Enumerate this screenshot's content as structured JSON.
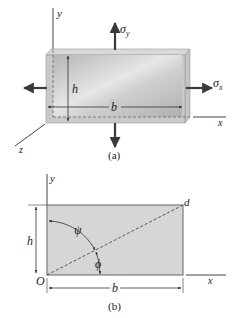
{
  "figure_a": {
    "caption": "(a)",
    "axis_labels": {
      "y": "y",
      "x": "x",
      "z": "z"
    },
    "dimension_labels": {
      "height": "h",
      "width": "b"
    },
    "stress_labels": {
      "sigma_y": "σ",
      "sigma_y_sub": "y",
      "sigma_x": "σ",
      "sigma_x_sub": "x"
    }
  },
  "figure_b": {
    "caption": "(b)",
    "axis_labels": {
      "y": "y",
      "x": "x"
    },
    "point_labels": {
      "origin": "O",
      "corner": "d"
    },
    "dimension_labels": {
      "height": "h",
      "width": "b"
    },
    "angle_labels": {
      "psi": "ψ",
      "phi": "ϕ"
    }
  },
  "colors": {
    "line": "#333333",
    "plate_face": "#c8c8c8",
    "plate_edge": "#b8b8b8",
    "rect_fill": "#d6d6d6",
    "arrow": "#3a3a3a"
  }
}
